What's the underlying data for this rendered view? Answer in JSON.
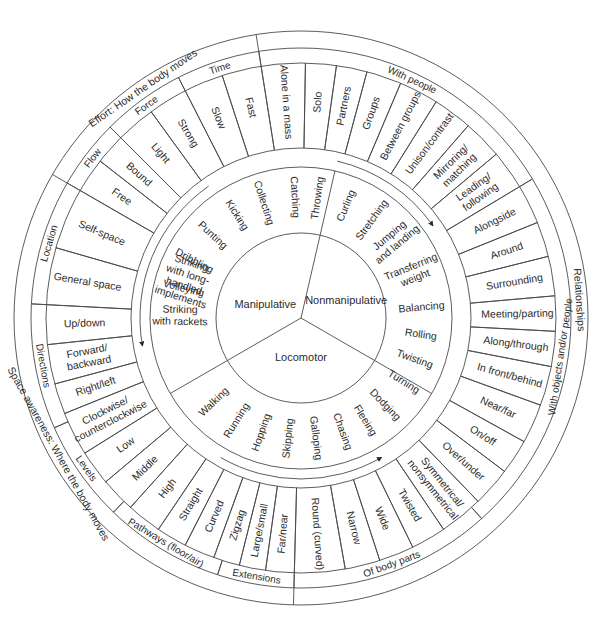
{
  "center": {
    "x": 301,
    "y": 318
  },
  "radii": {
    "outer": 287,
    "top_inner": 270,
    "cat_inner": 255,
    "sub_inner": 170,
    "skill_outer": 151,
    "core": 85
  },
  "colors": {
    "line": "#4a4a4a",
    "text": "#2b2b2b",
    "background": "#ffffff"
  },
  "core": {
    "dividers": [
      -77,
      30,
      150
    ],
    "labels": [
      {
        "text": "Manipulative",
        "angle": 200,
        "r": 38
      },
      {
        "text": "Nonmanipulative",
        "angle": -20,
        "r": 48
      },
      {
        "text": "Locomotor",
        "angle": 90,
        "r": 40
      }
    ]
  },
  "skills": {
    "dividers": [
      -77,
      30,
      150
    ],
    "arrows": [
      {
        "from": 235,
        "to": 170,
        "r": 161
      },
      {
        "from": 283,
        "to": 325,
        "r": 161
      },
      {
        "from": 120,
        "to": 60,
        "r": 161
      }
    ],
    "items": [
      {
        "text": "Catching",
        "angle": -93
      },
      {
        "text": "Collecting",
        "angle": -108
      },
      {
        "text": "Kicking",
        "angle": -122
      },
      {
        "text": "Punting",
        "angle": -137
      },
      {
        "text": "Dribbling",
        "angle": -152
      },
      {
        "text": "Volleying",
        "angle": -166
      },
      {
        "text": "Striking with rackets",
        "lines": [
          "Striking",
          "with rackets"
        ],
        "angle": 181
      },
      {
        "text": "Striking with long-handled implements",
        "lines": [
          "Striking",
          "with long-",
          "handled",
          "implements"
        ],
        "angle": 198
      },
      {
        "text": "Throwing",
        "angle": -82
      },
      {
        "text": "Curling",
        "angle": -68
      },
      {
        "text": "Stretching",
        "angle": -54
      },
      {
        "text": "Jumping and landing",
        "lines": [
          "Jumping",
          "and landing"
        ],
        "angle": -40
      },
      {
        "text": "Transferring weight",
        "lines": [
          "Transferring",
          "weight"
        ],
        "angle": -22
      },
      {
        "text": "Balancing",
        "angle": -5
      },
      {
        "text": "Rolling",
        "angle": 8
      },
      {
        "text": "Twisting",
        "angle": 20
      },
      {
        "text": "Turning",
        "angle": 32
      },
      {
        "text": "Dodging",
        "angle": 46
      },
      {
        "text": "Fleeing",
        "angle": 58
      },
      {
        "text": "Chasing",
        "angle": 70
      },
      {
        "text": "Galloping",
        "angle": 83
      },
      {
        "text": "Skipping",
        "angle": 96
      },
      {
        "text": "Hopping",
        "angle": 109
      },
      {
        "text": "Running",
        "angle": 122
      },
      {
        "text": "Walking",
        "angle": 136
      }
    ]
  },
  "concepts": {
    "categories": [
      {
        "group": "effort",
        "label": "Effort: How the body moves",
        "start": 210,
        "end": 261
      },
      {
        "group": "space",
        "label": "Space awareness: Where the body moves",
        "start": 91.5,
        "end": 210
      },
      {
        "group": "relationships",
        "label": "Relationships",
        "start": -99,
        "end": 91.5
      }
    ],
    "subcategories": [
      {
        "label": "Flow",
        "start": 210,
        "end": 225
      },
      {
        "label": "Force",
        "start": 225,
        "end": 243
      },
      {
        "label": "Time",
        "start": 243,
        "end": 261
      },
      {
        "label": "Location",
        "start": 183,
        "end": 210
      },
      {
        "label": "Directions",
        "start": 156,
        "end": 183
      },
      {
        "label": "Levels",
        "start": 134,
        "end": 156
      },
      {
        "label": "Pathways (floor/air)",
        "start": 108,
        "end": 134
      },
      {
        "label": "Extensions",
        "start": 91.5,
        "end": 108
      },
      {
        "label": "With people",
        "start": -99,
        "end": -31
      },
      {
        "label": "With objects and/or people",
        "start": -31,
        "end": 48
      },
      {
        "label": "Of body parts",
        "start": 48,
        "end": 91.5
      }
    ],
    "items": [
      {
        "label": "Free",
        "start": 210,
        "end": 218
      },
      {
        "label": "Bound",
        "start": 218,
        "end": 225
      },
      {
        "label": "Light",
        "start": 225,
        "end": 234
      },
      {
        "label": "Strong",
        "start": 234,
        "end": 243
      },
      {
        "label": "Slow",
        "start": 243,
        "end": 252
      },
      {
        "label": "Fast",
        "start": 252,
        "end": 261
      },
      {
        "label": "Self-space",
        "start": 196,
        "end": 210
      },
      {
        "label": "General space",
        "start": 183,
        "end": 196
      },
      {
        "label": "Up/down",
        "start": 174,
        "end": 183
      },
      {
        "label": "Forward/ backward",
        "lines": [
          "Forward/",
          "backward"
        ],
        "start": 165,
        "end": 174
      },
      {
        "label": "Right/left",
        "start": 158,
        "end": 165
      },
      {
        "label": "Clockwise/ counterclockwise",
        "lines": [
          "Clockwise/",
          "counterclockwise"
        ],
        "start": 148,
        "end": 158
      },
      {
        "label": "Low",
        "start": 140,
        "end": 148
      },
      {
        "label": "Middle",
        "start": 132,
        "end": 140
      },
      {
        "label": "High",
        "start": 124,
        "end": 132
      },
      {
        "label": "Straight",
        "start": 117,
        "end": 124
      },
      {
        "label": "Curved",
        "start": 110,
        "end": 117
      },
      {
        "label": "Zigzag",
        "start": 104,
        "end": 110
      },
      {
        "label": "Large/small",
        "start": 98,
        "end": 104
      },
      {
        "label": "Far/near",
        "start": 91.5,
        "end": 98
      },
      {
        "label": "Alone in a mass",
        "start": -99,
        "end": -89
      },
      {
        "label": "Solo",
        "start": -89,
        "end": -82
      },
      {
        "label": "Partners",
        "start": -82,
        "end": -75
      },
      {
        "label": "Groups",
        "start": -75,
        "end": -67
      },
      {
        "label": "Between groups",
        "start": -67,
        "end": -58
      },
      {
        "label": "Unison/contrast",
        "start": -58,
        "end": -49
      },
      {
        "label": "Mirroring/ matching",
        "lines": [
          "Mirroring/",
          "matching"
        ],
        "start": -49,
        "end": -40
      },
      {
        "label": "Leading/ following",
        "lines": [
          "Leading/",
          "following"
        ],
        "start": -40,
        "end": -31
      },
      {
        "label": "Alongside",
        "start": -31,
        "end": -22
      },
      {
        "label": "Around",
        "start": -22,
        "end": -14
      },
      {
        "label": "Surrounding",
        "start": -14,
        "end": -5
      },
      {
        "label": "Meeting/parting",
        "start": -5,
        "end": 3
      },
      {
        "label": "Along/through",
        "start": 3,
        "end": 11
      },
      {
        "label": "In front/behind",
        "start": 11,
        "end": 20
      },
      {
        "label": "Near/far",
        "start": 20,
        "end": 29
      },
      {
        "label": "On/off",
        "start": 29,
        "end": 37
      },
      {
        "label": "Over/under",
        "start": 37,
        "end": 46
      },
      {
        "label": "Symmetrical/ nonsymmetrical",
        "lines": [
          "Symmetrical/",
          "nonsymmetrical"
        ],
        "start": 46,
        "end": 56
      },
      {
        "label": "Twisted",
        "start": 56,
        "end": 64
      },
      {
        "label": "Wide",
        "start": 64,
        "end": 72
      },
      {
        "label": "Narrow",
        "start": 72,
        "end": 80
      },
      {
        "label": "Round (curved)",
        "start": 80,
        "end": 91.5
      }
    ]
  }
}
